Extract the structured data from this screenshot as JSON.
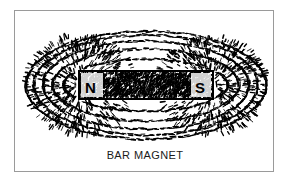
{
  "figure": {
    "caption": "BAR MAGNET",
    "background_color": "#ffffff",
    "frame_color": "#9a9a9a",
    "ink_color": "#000000"
  },
  "magnet": {
    "north_label": "N",
    "south_label": "S",
    "body_outline_color": "#000000",
    "body_fill_pattern": "iron-filings-speckle",
    "bar_rect": {
      "x": 64,
      "y": 60,
      "width": 134,
      "height": 28
    }
  },
  "field": {
    "description": "Iron filings aligned along magnetic field lines of a bar magnet",
    "pattern": "dashed-concentric-loops",
    "loop_count_per_side": 6,
    "pole_radiation": "spray"
  },
  "chart_data": {
    "type": "scatter",
    "title": "BAR MAGNET",
    "xlabel": "",
    "ylabel": "",
    "xlim": [
      0,
      260
    ],
    "ylim": [
      0,
      162
    ],
    "grid": false,
    "legend": null,
    "annotations": [
      {
        "text": "N",
        "x": 76,
        "y": 74
      },
      {
        "text": "S",
        "x": 186,
        "y": 74
      },
      {
        "text": "BAR MAGNET",
        "x": 130,
        "y": 146
      }
    ],
    "series": [
      {
        "name": "field-loops-top",
        "loops": [
          {
            "rx": 70,
            "ry": 14,
            "cx": 131,
            "cy": 74
          },
          {
            "rx": 82,
            "ry": 26,
            "cx": 131,
            "cy": 74
          },
          {
            "rx": 93,
            "ry": 36,
            "cx": 131,
            "cy": 74
          },
          {
            "rx": 103,
            "ry": 44,
            "cx": 131,
            "cy": 74
          },
          {
            "rx": 112,
            "ry": 50,
            "cx": 131,
            "cy": 74
          },
          {
            "rx": 120,
            "ry": 54,
            "cx": 131,
            "cy": 74
          }
        ]
      },
      {
        "name": "field-loops-bottom",
        "loops": [
          {
            "rx": 70,
            "ry": 14,
            "cx": 131,
            "cy": 74
          },
          {
            "rx": 82,
            "ry": 26,
            "cx": 131,
            "cy": 74
          },
          {
            "rx": 93,
            "ry": 36,
            "cx": 131,
            "cy": 74
          },
          {
            "rx": 103,
            "ry": 44,
            "cx": 131,
            "cy": 74
          },
          {
            "rx": 112,
            "ry": 50,
            "cx": 131,
            "cy": 74
          },
          {
            "rx": 120,
            "ry": 54,
            "cx": 131,
            "cy": 74
          }
        ]
      }
    ]
  }
}
